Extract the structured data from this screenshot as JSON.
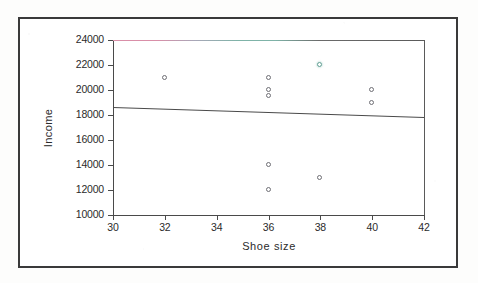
{
  "figure": {
    "background_color": "#ffffff",
    "frame_color": "#3a3a3a"
  },
  "chart_data": {
    "type": "scatter",
    "title": "",
    "subtitle": "",
    "xlabel": "Shoe size",
    "ylabel": "Income",
    "xlim": [
      30,
      42
    ],
    "ylim": [
      10000,
      24000
    ],
    "xticks": [
      30,
      32,
      34,
      36,
      38,
      40,
      42
    ],
    "xtick_labels": [
      "30",
      "32",
      "34",
      "36",
      "38",
      "40",
      "42"
    ],
    "yticks": [
      10000,
      12000,
      14000,
      16000,
      18000,
      20000,
      22000,
      24000
    ],
    "ytick_labels": [
      "10000",
      "12000",
      "14000",
      "16000",
      "18000",
      "20000",
      "22000",
      "24000"
    ],
    "grid": false,
    "legend": null,
    "marker_style": "open-circle",
    "marker_color": "#6e6e74",
    "points": [
      {
        "x": 32,
        "y": 21000,
        "color": "#6e6e74",
        "tinted": false
      },
      {
        "x": 36,
        "y": 21000,
        "color": "#6e6e74",
        "tinted": false
      },
      {
        "x": 36,
        "y": 20000,
        "color": "#6e6e74",
        "tinted": false
      },
      {
        "x": 36,
        "y": 19500,
        "color": "#6e6e74",
        "tinted": false
      },
      {
        "x": 38,
        "y": 22000,
        "color": "#5f9e92",
        "tinted": true
      },
      {
        "x": 40,
        "y": 20000,
        "color": "#6e6e74",
        "tinted": false
      },
      {
        "x": 40,
        "y": 19000,
        "color": "#6e6e74",
        "tinted": false
      },
      {
        "x": 36,
        "y": 14000,
        "color": "#6e6e74",
        "tinted": false
      },
      {
        "x": 38,
        "y": 13000,
        "color": "#6e6e74",
        "tinted": false
      },
      {
        "x": 36,
        "y": 12000,
        "color": "#6e6e74",
        "tinted": false
      }
    ],
    "trendline": {
      "name": "regression-line",
      "x_start": 30,
      "y_start": 18600,
      "x_end": 42,
      "y_end": 17800,
      "color": "#4a4a4a"
    }
  }
}
